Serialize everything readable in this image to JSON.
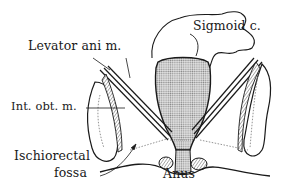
{
  "figure": {
    "colors": {
      "ink": "#1a1a1a",
      "stipple": "#b9b9b9",
      "hatch": "#6a6a6a",
      "background": "#ffffff"
    }
  },
  "labels": {
    "sigmoid": "Sigmoid c.",
    "levator": "Levator ani m.",
    "int_obt": "Int. obt. m.",
    "ischiorectal_line1": "Ischiorectal",
    "ischiorectal_line2": "fossa",
    "anus": "Anus"
  }
}
